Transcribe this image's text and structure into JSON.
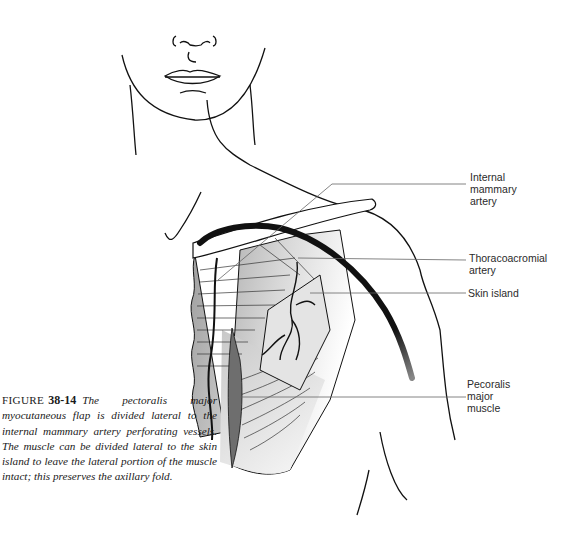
{
  "figure": {
    "label_prefix": "FIGURE",
    "number": "38-14",
    "caption": "The pectoralis major myocutaneous flap is divided lateral to the internal mammary artery perforating vessels. The muscle can be divided lateral to the skin island to leave the lateral portion of the muscle intact; this preserves the axillary fold."
  },
  "labels": {
    "internal_mammary": [
      "Internal",
      "mammary",
      "artery"
    ],
    "thoracoacromial": [
      "Thoracoacromial",
      "artery"
    ],
    "skin_island": [
      "Skin island"
    ],
    "pectoralis": [
      "Pecoralis",
      "major",
      "muscle"
    ]
  },
  "colors": {
    "line": "#111111",
    "muscle_gray": "#a8a8a8",
    "muscle_dark": "#6e6e6e",
    "leader": "#555555"
  }
}
